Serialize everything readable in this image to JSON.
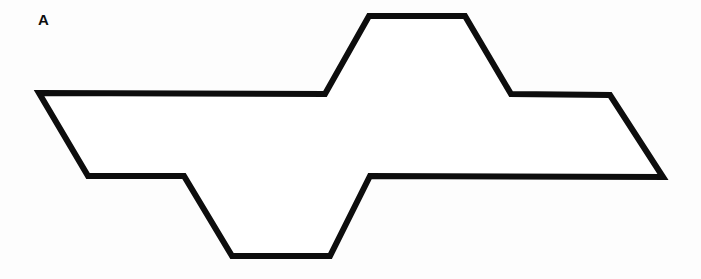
{
  "figure": {
    "panel_label": "A",
    "background_color": "#fdfdfd",
    "stroke_color": "#0d0d0d",
    "fill_color": "#ffffff",
    "stroke_width": 6,
    "canvas": {
      "width": 701,
      "height": 279
    }
  },
  "chart_data": {
    "type": "scatter",
    "title": "A",
    "subtitle": "",
    "xlabel": "",
    "ylabel": "",
    "grid": false,
    "legend_position": "none",
    "xlim": [
      0,
      701
    ],
    "ylim": [
      279,
      0
    ],
    "annotations": [
      {
        "text": "A",
        "x": 44,
        "y": 22,
        "bold": true
      }
    ],
    "series": [
      {
        "name": "outline-polygon",
        "closed": true,
        "stroke": "#0d0d0d",
        "fill": "#ffffff",
        "linewidth": 6,
        "x": [
          39,
          325,
          369,
          465,
          511,
          610,
          663,
          370,
          330,
          232,
          184,
          88
        ],
        "y": [
          93,
          94,
          16,
          16,
          94,
          95,
          177,
          176,
          256,
          256,
          176,
          176
        ],
        "points": [
          [
            39,
            93
          ],
          [
            325,
            94
          ],
          [
            369,
            16
          ],
          [
            465,
            16
          ],
          [
            511,
            94
          ],
          [
            610,
            95
          ],
          [
            663,
            177
          ],
          [
            370,
            176
          ],
          [
            330,
            256
          ],
          [
            232,
            256
          ],
          [
            184,
            176
          ],
          [
            88,
            176
          ]
        ]
      }
    ]
  }
}
